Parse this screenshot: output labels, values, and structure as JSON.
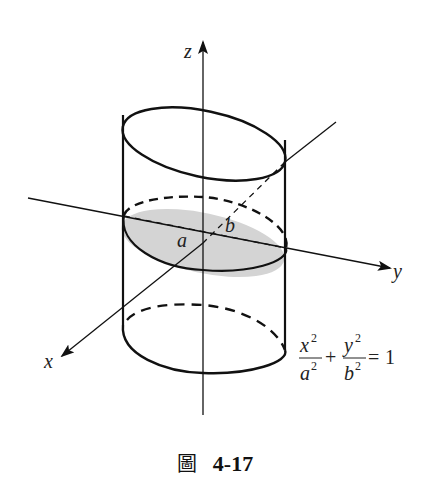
{
  "figure": {
    "axes": {
      "x_label": "x",
      "y_label": "y",
      "z_label": "z"
    },
    "cross_section_labels": {
      "a": "a",
      "b": "b"
    },
    "equation": {
      "x_num": "x",
      "x_den": "a",
      "y_num": "y",
      "y_den": "b",
      "exp": "2",
      "plus": "+",
      "equals": "=",
      "rhs": "1"
    },
    "colors": {
      "stroke": "#111111",
      "cross_section_fill": "#d4d4d4"
    },
    "caption": {
      "glyph": "圖",
      "number": "4-17"
    }
  }
}
